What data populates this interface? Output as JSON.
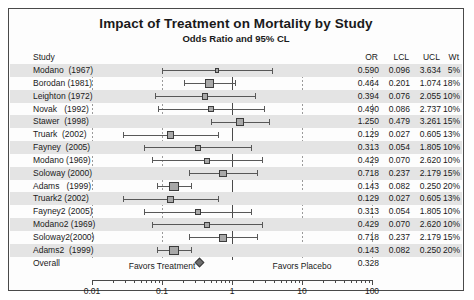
{
  "chart_data": {
    "type": "forest",
    "title": "Impact of Treatment on Mortality by Study",
    "subtitle": "Odds Ratio and 95% CL",
    "xlabel": "",
    "ylabel": "",
    "xscale": "log",
    "xlim": [
      0.01,
      100
    ],
    "xticks": [
      0.01,
      0.1,
      1,
      10,
      100
    ],
    "xticklabels": [
      "0.01",
      "0.1",
      "1",
      "10",
      "100"
    ],
    "reference_line": 1,
    "grid": false,
    "columns": [
      "Study",
      "OR",
      "LCL",
      "UCL",
      "Wt"
    ],
    "left_annotation": "Favors Treatment",
    "right_annotation": "Favors Placebo",
    "rows": [
      {
        "study": "Modano  (1967)",
        "or": 0.59,
        "lcl": 0.096,
        "ucl": 3.634,
        "wt": 5,
        "or_text": "0.590",
        "lcl_text": "0.096",
        "ucl_text": "3.634",
        "wt_text": "5%"
      },
      {
        "study": "Borodan (1981)",
        "or": 0.464,
        "lcl": 0.201,
        "ucl": 1.074,
        "wt": 18,
        "or_text": "0.464",
        "lcl_text": "0.201",
        "ucl_text": "1.074",
        "wt_text": "18%"
      },
      {
        "study": "Leighton (1972)",
        "or": 0.394,
        "lcl": 0.076,
        "ucl": 2.055,
        "wt": 10,
        "or_text": "0.394",
        "lcl_text": "0.076",
        "ucl_text": "2.055",
        "wt_text": "10%"
      },
      {
        "study": "Novak   (1992)",
        "or": 0.49,
        "lcl": 0.086,
        "ucl": 2.737,
        "wt": 10,
        "or_text": "0.490",
        "lcl_text": "0.086",
        "ucl_text": "2.737",
        "wt_text": "10%"
      },
      {
        "study": "Stawer  (1998)",
        "or": 1.25,
        "lcl": 0.479,
        "ucl": 3.261,
        "wt": 15,
        "or_text": "1.250",
        "lcl_text": "0.479",
        "ucl_text": "3.261",
        "wt_text": "15%"
      },
      {
        "study": "Truark  (2002)",
        "or": 0.129,
        "lcl": 0.027,
        "ucl": 0.605,
        "wt": 13,
        "or_text": "0.129",
        "lcl_text": "0.027",
        "ucl_text": "0.605",
        "wt_text": "13%"
      },
      {
        "study": "Fayney  (2005)",
        "or": 0.313,
        "lcl": 0.054,
        "ucl": 1.805,
        "wt": 10,
        "or_text": "0.313",
        "lcl_text": "0.054",
        "ucl_text": "1.805",
        "wt_text": "10%"
      },
      {
        "study": "Modano (1969)",
        "or": 0.429,
        "lcl": 0.07,
        "ucl": 2.62,
        "wt": 10,
        "or_text": "0.429",
        "lcl_text": "0.070",
        "ucl_text": "2.620",
        "wt_text": "10%"
      },
      {
        "study": "Soloway (2000)",
        "or": 0.718,
        "lcl": 0.237,
        "ucl": 2.179,
        "wt": 15,
        "or_text": "0.718",
        "lcl_text": "0.237",
        "ucl_text": "2.179",
        "wt_text": "15%"
      },
      {
        "study": "Adams   (1999)",
        "or": 0.143,
        "lcl": 0.082,
        "ucl": 0.25,
        "wt": 20,
        "or_text": "0.143",
        "lcl_text": "0.082",
        "ucl_text": "0.250",
        "wt_text": "20%"
      },
      {
        "study": "Truark2 (2002)",
        "or": 0.129,
        "lcl": 0.027,
        "ucl": 0.605,
        "wt": 13,
        "or_text": "0.129",
        "lcl_text": "0.027",
        "ucl_text": "0.605",
        "wt_text": "13%"
      },
      {
        "study": "Fayney2 (2005)",
        "or": 0.313,
        "lcl": 0.054,
        "ucl": 1.805,
        "wt": 10,
        "or_text": "0.313",
        "lcl_text": "0.054",
        "ucl_text": "1.805",
        "wt_text": "10%"
      },
      {
        "study": "Modano2 (1969)",
        "or": 0.429,
        "lcl": 0.07,
        "ucl": 2.62,
        "wt": 10,
        "or_text": "0.429",
        "lcl_text": "0.070",
        "ucl_text": "2.620",
        "wt_text": "10%"
      },
      {
        "study": "Soloway2(2000)",
        "or": 0.718,
        "lcl": 0.237,
        "ucl": 2.179,
        "wt": 15,
        "or_text": "0.718",
        "lcl_text": "0.237",
        "ucl_text": "2.179",
        "wt_text": "15%"
      },
      {
        "study": "Adams2  (1999)",
        "or": 0.143,
        "lcl": 0.082,
        "ucl": 0.25,
        "wt": 20,
        "or_text": "0.143",
        "lcl_text": "0.082",
        "ucl_text": "0.250",
        "wt_text": "20%"
      },
      {
        "study": "Overall",
        "or": 0.328,
        "lcl": null,
        "ucl": null,
        "wt": null,
        "or_text": "0.328",
        "lcl_text": "",
        "ucl_text": "",
        "wt_text": "",
        "summary": true
      }
    ]
  },
  "header": {
    "study": "Study",
    "or": "OR",
    "lcl": "LCL",
    "ucl": "UCL",
    "wt": "Wt"
  },
  "colors": {
    "box_fill": "#a8a8a8",
    "box_edge": "#3c3c3c",
    "band": "#e4e4e4",
    "axis": "#4a4a4a",
    "text": "#1a1a1a"
  }
}
